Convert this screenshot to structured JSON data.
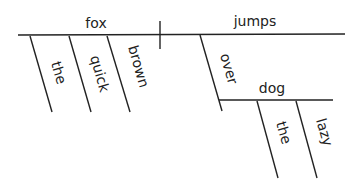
{
  "diagram": {
    "type": "sentence-diagram",
    "sentence": "The quick brown fox jumps over the lazy dog",
    "subject": "fox",
    "predicate": "jumps",
    "subject_modifiers": [
      "the",
      "quick",
      "brown"
    ],
    "preposition": "over",
    "prep_object": "dog",
    "object_modifiers": [
      "the",
      "lazy"
    ]
  }
}
